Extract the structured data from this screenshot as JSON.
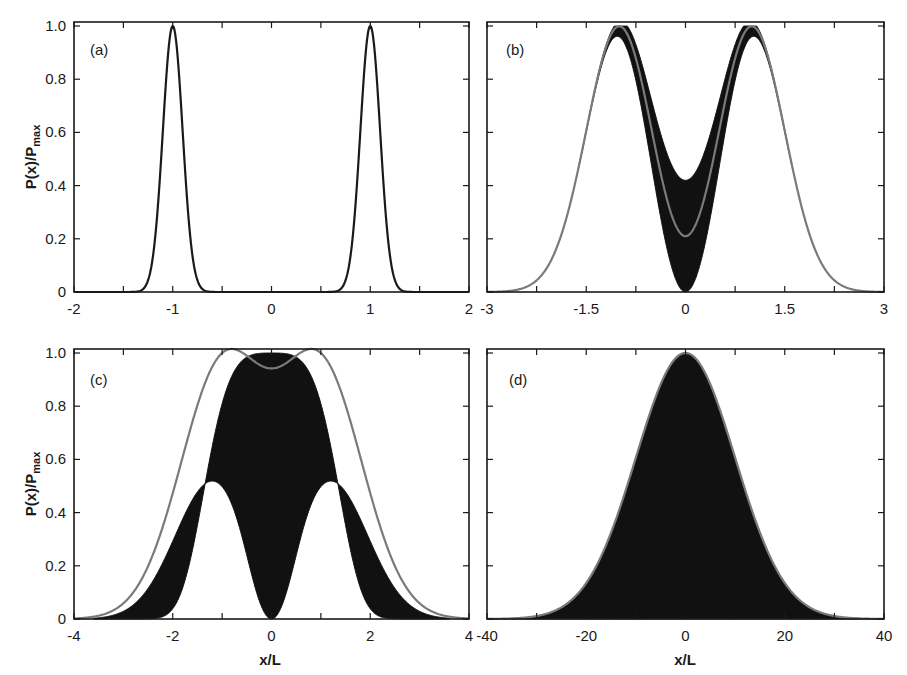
{
  "figure": {
    "ylabel_main": "P(x)/P",
    "ylabel_sub": "max",
    "xlabel": "x/L"
  },
  "chart_data": [
    {
      "panel": "(a)",
      "type": "line",
      "xlim": [
        -2,
        2
      ],
      "ylim": [
        0,
        1.0
      ],
      "xticks": [
        -2,
        -1,
        0,
        1,
        2
      ],
      "xtick_labels": [
        "-2",
        "-1",
        "0",
        "1",
        "2"
      ],
      "yticks": [
        0,
        0.2,
        0.4,
        0.6,
        0.8,
        1.0
      ],
      "ytick_labels": [
        "0",
        "0.2",
        "0.4",
        "0.6",
        "0.8",
        "1.0"
      ],
      "ylabel": "P(x)/P_max",
      "xlabel": "",
      "series": [
        {
          "name": "probability density",
          "color": "#1a1a1a",
          "model": "two gaussians",
          "centers": [
            -1,
            1
          ],
          "sigma": 0.1,
          "peak": 1.0
        }
      ]
    },
    {
      "panel": "(b)",
      "type": "area",
      "xlim": [
        -3,
        3
      ],
      "ylim": [
        0,
        1.0
      ],
      "xticks": [
        -3,
        -1.5,
        0,
        1.5,
        3
      ],
      "xtick_labels": [
        "-3",
        "-1.5",
        "0",
        "1.5",
        "3"
      ],
      "yticks": [
        0,
        0.2,
        0.4,
        0.6,
        0.8,
        1.0
      ],
      "ylabel": "",
      "xlabel": "",
      "series": [
        {
          "name": "oscillating band (black)",
          "color": "#111111",
          "peaks_at": [
            -1,
            1
          ],
          "peak": 1.0,
          "center_min": 0.0,
          "center_max": 0.42
        },
        {
          "name": "envelope (gray)",
          "color": "#7a7a7a",
          "peaks_at": [
            -1,
            1
          ],
          "peak": 1.0,
          "center_value": 0.21
        }
      ]
    },
    {
      "panel": "(c)",
      "type": "area",
      "xlim": [
        -4,
        4
      ],
      "ylim": [
        0,
        1.0
      ],
      "xticks": [
        -4,
        -2,
        0,
        2,
        4
      ],
      "xtick_labels": [
        "-4",
        "-2",
        "0",
        "2",
        "4"
      ],
      "yticks": [
        0,
        0.2,
        0.4,
        0.6,
        0.8,
        1.0
      ],
      "ytick_labels": [
        "0",
        "0.2",
        "0.4",
        "0.6",
        "0.8",
        "1.0"
      ],
      "ylabel": "P(x)/P_max",
      "xlabel": "x/L",
      "series": [
        {
          "name": "oscillating band (black)",
          "color": "#111111",
          "upper_center": 1.0,
          "lower_peaks_at": [
            -1.2,
            1.2
          ],
          "lower_peak": 0.52,
          "lower_center": 0.0
        },
        {
          "name": "envelope (gray)",
          "color": "#7a7a7a",
          "peaks_at": [
            -1,
            1
          ],
          "peak": 1.0,
          "center_value": 0.73
        }
      ]
    },
    {
      "panel": "(d)",
      "type": "area",
      "xlim": [
        -40,
        40
      ],
      "ylim": [
        0,
        1.0
      ],
      "xticks": [
        -40,
        -20,
        0,
        20,
        40
      ],
      "xtick_labels": [
        "-40",
        "-20",
        "0",
        "20",
        "40"
      ],
      "yticks": [
        0,
        0.2,
        0.4,
        0.6,
        0.8,
        1.0
      ],
      "ylabel": "",
      "xlabel": "x/L",
      "series": [
        {
          "name": "filled gaussian (black)",
          "color": "#111111",
          "center": 0,
          "sigma": 10,
          "peak": 1.0
        },
        {
          "name": "envelope (gray)",
          "color": "#7a7a7a",
          "center": 0,
          "sigma": 10,
          "peak": 1.0
        }
      ]
    }
  ]
}
